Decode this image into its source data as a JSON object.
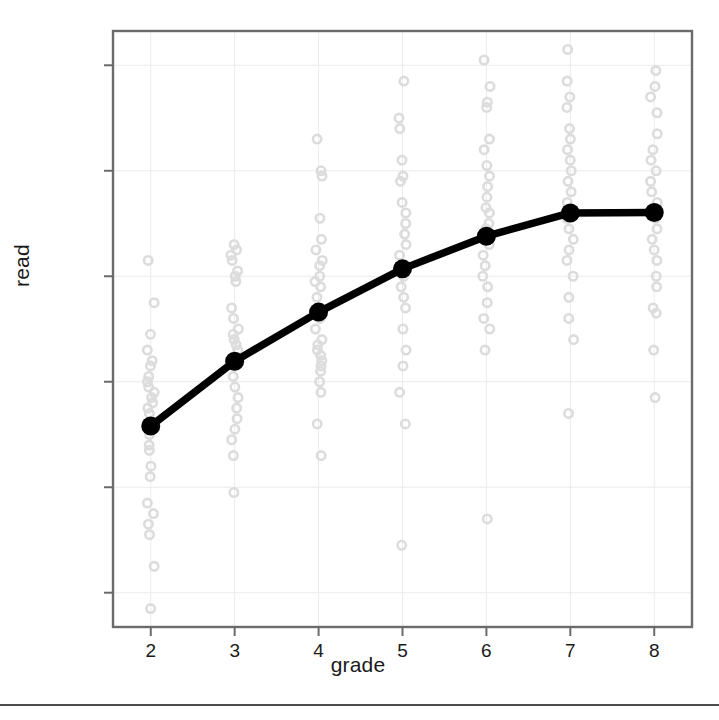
{
  "chart_data": {
    "type": "scatter",
    "title": "",
    "xlabel": "grade",
    "ylabel": "read",
    "xlim": [
      1.55,
      8.45
    ],
    "ylim": [
      133.5,
      246.5
    ],
    "xticks": [
      2,
      3,
      4,
      5,
      6,
      7,
      8
    ],
    "yticks": [
      140,
      160,
      180,
      200,
      220,
      240
    ],
    "grid": true,
    "legend": "none",
    "series": [
      {
        "name": "mean read by grade",
        "style": "line-with-markers",
        "color": "#000000",
        "marker": "filled-circle",
        "x": [
          2,
          3,
          4,
          5,
          6,
          7,
          8
        ],
        "values": [
          171.6,
          183.9,
          193.2,
          201.4,
          207.6,
          212.0,
          212.1
        ]
      },
      {
        "name": "individual observations",
        "style": "points",
        "color": "#d8d8d8",
        "marker": "open-circle",
        "jittered_strips": true,
        "points": [
          {
            "grade": 2,
            "read": [
              203,
              195,
              189,
              186,
              184,
              183,
              181,
              180,
              179,
              178,
              177,
              176,
              175,
              174,
              172,
              171,
              170,
              168,
              167,
              164,
              162,
              157,
              155,
              153,
              151,
              145,
              137
            ]
          },
          {
            "grade": 3,
            "read": [
              206,
              205,
              204,
              203,
              201,
              200,
              199,
              194,
              192,
              190,
              189,
              188,
              187,
              186,
              184,
              183,
              181,
              179,
              177,
              175,
              173,
              171,
              169,
              166,
              159
            ]
          },
          {
            "grade": 4,
            "read": [
              226,
              220,
              219,
              211,
              207,
              205,
              203,
              202,
              200,
              199,
              198,
              196,
              194,
              192,
              190,
              188,
              187,
              186,
              185,
              184,
              183,
              182,
              180,
              178,
              172,
              166
            ]
          },
          {
            "grade": 5,
            "read": [
              237,
              230,
              228,
              222,
              219,
              218,
              214,
              212,
              210,
              208,
              206,
              204,
              202,
              201,
              200,
              198,
              196,
              194,
              190,
              186,
              183,
              178,
              172,
              149
            ]
          },
          {
            "grade": 6,
            "read": [
              241,
              236,
              233,
              232,
              226,
              224,
              221,
              219,
              217,
              215,
              213,
              212,
              210,
              209,
              207,
              206,
              204,
              202,
              200,
              198,
              195,
              192,
              190,
              186,
              154
            ]
          },
          {
            "grade": 7,
            "read": [
              243,
              237,
              234,
              232,
              228,
              226,
              224,
              222,
              220,
              218,
              216,
              214,
              212,
              211,
              209,
              207,
              205,
              203,
              200,
              196,
              192,
              188,
              174
            ]
          },
          {
            "grade": 8,
            "read": [
              239,
              236,
              234,
              231,
              227,
              224,
              222,
              220,
              218,
              216,
              214,
              212,
              211,
              209,
              207,
              205,
              203,
              200,
              198,
              194,
              193,
              186,
              177
            ]
          }
        ]
      }
    ]
  },
  "axes": {
    "ylabel_text": "read",
    "xlabel_text": "grade",
    "ytick_labels": [
      "240",
      "220",
      "200",
      "180",
      "160",
      "140"
    ],
    "xtick_labels": [
      "2",
      "3",
      "4",
      "5",
      "6",
      "7",
      "8"
    ]
  },
  "colors": {
    "frame": "#6b6b6b",
    "grid": "#ebebeb",
    "line": "#000000",
    "points": "#dcdcdc",
    "text": "#1a1a1a",
    "rule": "#4c4c4c",
    "background": "#ffffff"
  }
}
